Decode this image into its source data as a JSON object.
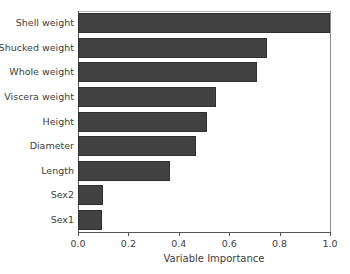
{
  "chart_data": {
    "type": "bar",
    "orientation": "horizontal",
    "title": "",
    "xlabel": "Variable Importance",
    "ylabel": "",
    "xlim": [
      0.0,
      1.0
    ],
    "xticks": [
      "0.0",
      "0.2",
      "0.4",
      "0.6",
      "0.8",
      "1.0"
    ],
    "xtick_values": [
      0.0,
      0.2,
      0.4,
      0.6,
      0.8,
      1.0
    ],
    "grid": false,
    "legend": null,
    "bar_color": "#414141",
    "background_color": "#ffffff",
    "categories": [
      "Shell weight",
      "Shucked weight",
      "Whole weight",
      "Viscera weight",
      "Height",
      "Diameter",
      "Length",
      "Sex2",
      "Sex1"
    ],
    "values": [
      1.0,
      0.75,
      0.71,
      0.548,
      0.512,
      0.468,
      0.365,
      0.099,
      0.095
    ]
  }
}
